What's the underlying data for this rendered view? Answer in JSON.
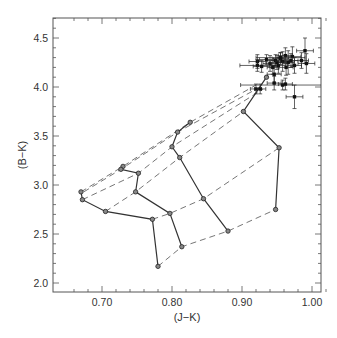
{
  "chart_data": {
    "type": "scatter",
    "title": "",
    "xlabel": "(J−K)",
    "ylabel": "(B−K)",
    "xlim": [
      0.64,
      1.022
    ],
    "ylim": [
      1.9,
      4.7
    ],
    "xticks": [
      0.7,
      0.8,
      0.9,
      1.0
    ],
    "xtick_labels": [
      "0.70",
      "0.80",
      "0.90",
      "1.00"
    ],
    "yticks": [
      2.0,
      2.5,
      3.0,
      3.5,
      4.0,
      4.5
    ],
    "ytick_labels": [
      "2.0",
      "2.5",
      "3.0",
      "3.5",
      "4.0",
      "4.5"
    ],
    "grid": false,
    "legend": null,
    "model_tracks_solid": [
      {
        "name": "track-1",
        "points": [
          [
            0.67,
            2.93
          ],
          [
            0.672,
            2.85
          ],
          [
            0.705,
            2.73
          ],
          [
            0.772,
            2.65
          ],
          [
            0.78,
            2.17
          ]
        ]
      },
      {
        "name": "track-2",
        "points": [
          [
            0.73,
            3.19
          ],
          [
            0.727,
            3.16
          ],
          [
            0.752,
            3.12
          ],
          [
            0.748,
            2.93
          ],
          [
            0.797,
            2.71
          ],
          [
            0.814,
            2.37
          ]
        ]
      },
      {
        "name": "track-3",
        "points": [
          [
            0.826,
            3.64
          ],
          [
            0.808,
            3.54
          ],
          [
            0.8,
            3.39
          ],
          [
            0.811,
            3.28
          ],
          [
            0.845,
            2.86
          ],
          [
            0.88,
            2.53
          ]
        ]
      },
      {
        "name": "track-4",
        "points": [
          [
            0.935,
            4.1
          ],
          [
            0.902,
            3.75
          ],
          [
            0.953,
            3.38
          ],
          [
            0.948,
            2.75
          ]
        ]
      }
    ],
    "isochrones_dashed": [
      [
        [
          0.67,
          2.93
        ],
        [
          0.73,
          3.19
        ],
        [
          0.826,
          3.64
        ],
        [
          0.92,
          4.02
        ]
      ],
      [
        [
          0.674,
          2.93
        ],
        [
          0.727,
          3.16
        ],
        [
          0.808,
          3.54
        ],
        [
          0.926,
          4.0
        ]
      ],
      [
        [
          0.672,
          2.85
        ],
        [
          0.752,
          3.12
        ],
        [
          0.8,
          3.39
        ],
        [
          0.93,
          3.98
        ]
      ],
      [
        [
          0.705,
          2.73
        ],
        [
          0.748,
          2.93
        ],
        [
          0.811,
          3.28
        ],
        [
          0.902,
          3.75
        ]
      ],
      [
        [
          0.772,
          2.65
        ],
        [
          0.797,
          2.71
        ],
        [
          0.845,
          2.86
        ],
        [
          0.953,
          3.38
        ]
      ],
      [
        [
          0.78,
          2.17
        ],
        [
          0.814,
          2.37
        ],
        [
          0.88,
          2.53
        ],
        [
          0.948,
          2.75
        ]
      ]
    ],
    "observed_points": [
      {
        "x": 0.922,
        "y": 4.26,
        "xerr": 0.012,
        "yerr": 0.07
      },
      {
        "x": 0.922,
        "y": 4.22,
        "xerr": 0.025,
        "yerr": 0.06
      },
      {
        "x": 0.928,
        "y": 4.21,
        "xerr": 0.012,
        "yerr": 0.06
      },
      {
        "x": 0.935,
        "y": 4.28,
        "xerr": 0.01,
        "yerr": 0.05
      },
      {
        "x": 0.94,
        "y": 4.24,
        "xerr": 0.01,
        "yerr": 0.08
      },
      {
        "x": 0.944,
        "y": 4.2,
        "xerr": 0.008,
        "yerr": 0.07
      },
      {
        "x": 0.946,
        "y": 4.13,
        "xerr": 0.01,
        "yerr": 0.09
      },
      {
        "x": 0.948,
        "y": 4.27,
        "xerr": 0.012,
        "yerr": 0.06
      },
      {
        "x": 0.95,
        "y": 4.25,
        "xerr": 0.01,
        "yerr": 0.07
      },
      {
        "x": 0.952,
        "y": 4.22,
        "xerr": 0.01,
        "yerr": 0.08
      },
      {
        "x": 0.955,
        "y": 4.29,
        "xerr": 0.012,
        "yerr": 0.06
      },
      {
        "x": 0.958,
        "y": 4.26,
        "xerr": 0.01,
        "yerr": 0.1
      },
      {
        "x": 0.962,
        "y": 4.32,
        "xerr": 0.01,
        "yerr": 0.08
      },
      {
        "x": 0.963,
        "y": 4.2,
        "xerr": 0.01,
        "yerr": 0.08
      },
      {
        "x": 0.966,
        "y": 4.25,
        "xerr": 0.008,
        "yerr": 0.12
      },
      {
        "x": 0.97,
        "y": 4.27,
        "xerr": 0.01,
        "yerr": 0.07
      },
      {
        "x": 0.972,
        "y": 4.31,
        "xerr": 0.012,
        "yerr": 0.1
      },
      {
        "x": 0.975,
        "y": 4.22,
        "xerr": 0.01,
        "yerr": 0.08
      },
      {
        "x": 0.985,
        "y": 4.27,
        "xerr": 0.01,
        "yerr": 0.08
      },
      {
        "x": 0.99,
        "y": 4.37,
        "xerr": 0.012,
        "yerr": 0.13
      },
      {
        "x": 0.992,
        "y": 4.24,
        "xerr": 0.012,
        "yerr": 0.1
      },
      {
        "x": 0.955,
        "y": 4.3,
        "xerr": 0.035,
        "yerr": 0.05
      },
      {
        "x": 0.92,
        "y": 3.98,
        "xerr": 0.008,
        "yerr": 0.05
      },
      {
        "x": 0.926,
        "y": 3.98,
        "xerr": 0.008,
        "yerr": 0.05
      },
      {
        "x": 0.946,
        "y": 4.04,
        "xerr": 0.01,
        "yerr": 0.07
      },
      {
        "x": 0.958,
        "y": 4.02,
        "xerr": 0.06,
        "yerr": 0.05
      },
      {
        "x": 0.962,
        "y": 4.03,
        "xerr": 0.01,
        "yerr": 0.06
      },
      {
        "x": 0.975,
        "y": 3.9,
        "xerr": 0.012,
        "yerr": 0.12
      }
    ]
  }
}
